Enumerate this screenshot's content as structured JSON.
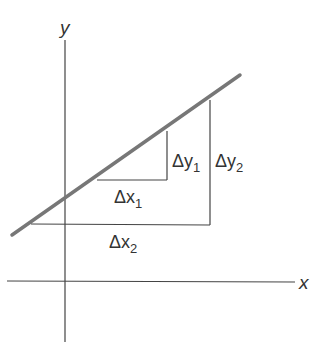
{
  "diagram": {
    "type": "slope-of-line",
    "axes": {
      "x_label": "x",
      "y_label": "y"
    },
    "line": {
      "from": [
        12,
        235
      ],
      "to": [
        240,
        75
      ],
      "color": "#777777"
    },
    "small_triangle": {
      "dx_label": "Δx",
      "dx_sub": "1",
      "dy_label": "Δy",
      "dy_sub": "1"
    },
    "large_triangle": {
      "dx_label": "Δx",
      "dx_sub": "2",
      "dy_label": "Δy",
      "dy_sub": "2"
    },
    "colors": {
      "axis": "#444444",
      "line": "#777777",
      "text": "#333333"
    }
  }
}
